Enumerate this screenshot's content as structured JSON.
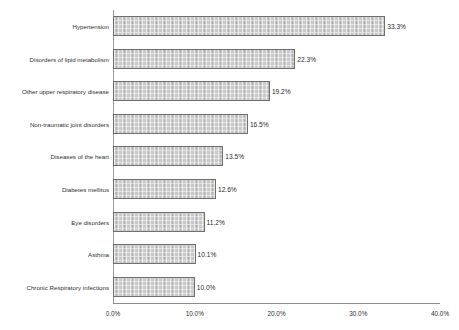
{
  "chart_data": {
    "type": "bar",
    "orientation": "horizontal",
    "title": "",
    "xlabel": "",
    "ylabel": "",
    "categories": [
      "Hypertension",
      "Disorders of lipid metabolism",
      "Other upper respiratory disease",
      "Non-traumatic joint disorders",
      "Diseases of the heart",
      "Diabetes mellitus",
      "Eye disorders",
      "Asthma",
      "Chronic Respiratory infections"
    ],
    "values": [
      33.3,
      22.3,
      19.2,
      16.5,
      13.5,
      12.6,
      11.2,
      10.1,
      10.0
    ],
    "data_labels": [
      "33.3%",
      "22.3%",
      "19.2%",
      "16.5%",
      "13.5%",
      "12.6%",
      "11.2%",
      "10.1%",
      "10.0%"
    ],
    "xlim": [
      0,
      40
    ],
    "xticks": [
      0,
      10,
      20,
      30,
      40
    ],
    "xtick_labels": [
      "0.0%",
      "10.0%",
      "20.0%",
      "30.0%",
      "40.0%"
    ],
    "grid": false,
    "legend": null,
    "bar_fill_color": "#c9c9c9",
    "bar_border_color": "#6f6f6f",
    "background_color": "#ffffff",
    "text_color": "#2f2f2f"
  }
}
